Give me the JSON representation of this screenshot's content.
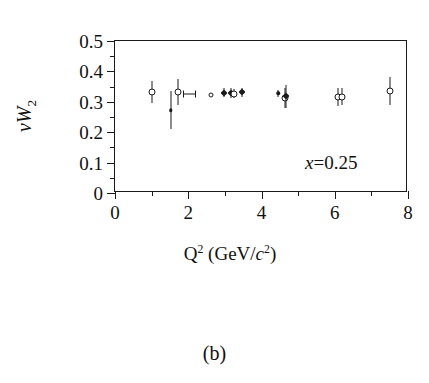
{
  "figure": {
    "panel_caption": "(b)"
  },
  "chart_data": {
    "type": "scatter",
    "title": "",
    "xlabel": "Q² (GeV/c²)",
    "ylabel": "νW₂",
    "xlabel_parts": {
      "base": "Q",
      "exponent": "2",
      "unit_open": " (GeV/",
      "unit_italic": "c",
      "unit_exp": "2",
      "unit_close": ")"
    },
    "ylabel_parts": {
      "nu": "ν",
      "w": "W",
      "sub": "2"
    },
    "annotation": {
      "variable": "x",
      "equals": "=",
      "value": "0.25",
      "text": "x=0.25"
    },
    "xlim": [
      0,
      8
    ],
    "ylim": [
      0,
      0.5
    ],
    "grid": false,
    "legend": "none",
    "xticks_major": [
      0,
      2,
      4,
      6,
      8
    ],
    "xticks_major_labels": [
      "0",
      "2",
      "4",
      "6",
      "8"
    ],
    "xticks_minor": [
      1,
      3,
      5,
      7
    ],
    "yticks_major": [
      0,
      0.1,
      0.2,
      0.3,
      0.4,
      0.5
    ],
    "yticks_major_labels": [
      "0",
      "0.1",
      "0.2",
      "0.3",
      "0.4",
      "0.5"
    ],
    "yticks_minor": [
      0.05,
      0.15,
      0.25,
      0.35,
      0.45
    ],
    "points": [
      {
        "x": 1.0,
        "y": 0.332,
        "yerr": 0.035,
        "xerr": 0,
        "marker": "open-circle"
      },
      {
        "x": 1.52,
        "y": 0.272,
        "yerr": 0.062,
        "xerr": 0,
        "marker": "filled-dot"
      },
      {
        "x": 1.73,
        "y": 0.332,
        "yerr": 0.042,
        "xerr": 0,
        "marker": "open-circle"
      },
      {
        "x": 2.02,
        "y": 0.327,
        "yerr": 0,
        "xerr": 0.17,
        "marker": "none-hbar"
      },
      {
        "x": 2.62,
        "y": 0.322,
        "yerr": 0,
        "xerr": 0,
        "marker": "small-open-circle"
      },
      {
        "x": 2.98,
        "y": 0.33,
        "yerr": 0.014,
        "xerr": 0,
        "marker": "filled-diamond"
      },
      {
        "x": 3.16,
        "y": 0.33,
        "yerr": 0.016,
        "xerr": 0,
        "marker": "filled-diamond"
      },
      {
        "x": 3.24,
        "y": 0.327,
        "yerr": 0.016,
        "xerr": 0,
        "marker": "open-circle"
      },
      {
        "x": 3.48,
        "y": 0.331,
        "yerr": 0.014,
        "xerr": 0,
        "marker": "filled-diamond"
      },
      {
        "x": 4.46,
        "y": 0.328,
        "yerr": 0.012,
        "xerr": 0,
        "marker": "filled-dot"
      },
      {
        "x": 4.63,
        "y": 0.312,
        "yerr": 0.033,
        "xerr": 0,
        "marker": "open-circle"
      },
      {
        "x": 4.68,
        "y": 0.318,
        "yerr": 0.038,
        "xerr": 0,
        "marker": "filled-diamond"
      },
      {
        "x": 6.08,
        "y": 0.315,
        "yerr": 0.03,
        "xerr": 0,
        "marker": "open-circle"
      },
      {
        "x": 6.2,
        "y": 0.316,
        "yerr": 0.028,
        "xerr": 0,
        "marker": "open-circle"
      },
      {
        "x": 7.5,
        "y": 0.335,
        "yerr": 0.045,
        "xerr": 0,
        "marker": "open-circle"
      }
    ]
  }
}
